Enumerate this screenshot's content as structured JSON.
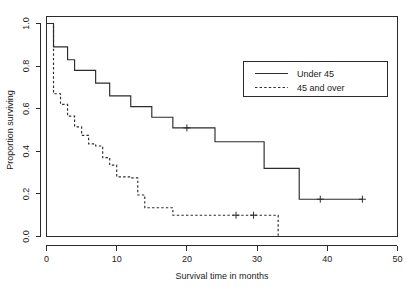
{
  "chart_data": {
    "type": "line",
    "title": "",
    "xlabel": "Survival time in months",
    "ylabel": "Proportion surviving",
    "xlim": [
      0,
      50
    ],
    "ylim": [
      0,
      1.0
    ],
    "xticks": [
      0,
      10,
      20,
      30,
      40,
      50
    ],
    "xtick_labels": [
      "0",
      "10",
      "20",
      "30",
      "40",
      "50"
    ],
    "yticks": [
      0.0,
      0.2,
      0.4,
      0.6,
      0.8,
      1.0
    ],
    "ytick_labels": [
      "0.0",
      "0.2",
      "0.4",
      "0.6",
      "0.8",
      "1.0"
    ],
    "grid": false,
    "legend_position": "upper right",
    "plot_style": "step-post",
    "series": [
      {
        "name": "Under 45",
        "linestyle": "solid",
        "color": "#2b2b2b",
        "x": [
          0,
          1,
          3,
          4,
          7,
          9,
          12,
          15,
          18,
          24,
          31,
          36,
          45
        ],
        "y": [
          1.0,
          0.89,
          0.83,
          0.78,
          0.72,
          0.66,
          0.61,
          0.56,
          0.51,
          0.445,
          0.445,
          0.32,
          0.175
        ],
        "steps": [
          {
            "time": 0,
            "survival": 1.0
          },
          {
            "time": 1,
            "survival": 0.89
          },
          {
            "time": 3,
            "survival": 0.83
          },
          {
            "time": 4,
            "survival": 0.78
          },
          {
            "time": 7,
            "survival": 0.72
          },
          {
            "time": 9,
            "survival": 0.66
          },
          {
            "time": 12,
            "survival": 0.61
          },
          {
            "time": 15,
            "survival": 0.56
          },
          {
            "time": 18,
            "survival": 0.51
          },
          {
            "time": 24,
            "survival": 0.445
          },
          {
            "time": 31,
            "survival": 0.32
          },
          {
            "time": 36,
            "survival": 0.175
          },
          {
            "time": 45,
            "survival": 0.175
          }
        ],
        "censored": [
          {
            "time": 20,
            "survival": 0.51
          },
          {
            "time": 39,
            "survival": 0.175
          },
          {
            "time": 45,
            "survival": 0.175
          }
        ]
      },
      {
        "name": "45 and over",
        "linestyle": "dashed",
        "color": "#2b2b2b",
        "x": [
          0,
          1,
          2,
          3,
          4,
          5,
          6,
          7,
          8,
          9,
          10,
          12,
          13,
          14,
          18,
          33
        ],
        "y": [
          1.0,
          0.67,
          0.62,
          0.565,
          0.515,
          0.475,
          0.435,
          0.425,
          0.37,
          0.335,
          0.28,
          0.275,
          0.195,
          0.135,
          0.1,
          0.0
        ],
        "steps": [
          {
            "time": 0,
            "survival": 1.0
          },
          {
            "time": 1,
            "survival": 0.67
          },
          {
            "time": 2,
            "survival": 0.62
          },
          {
            "time": 3,
            "survival": 0.565
          },
          {
            "time": 4,
            "survival": 0.515
          },
          {
            "time": 5,
            "survival": 0.475
          },
          {
            "time": 6,
            "survival": 0.435
          },
          {
            "time": 7,
            "survival": 0.425
          },
          {
            "time": 8,
            "survival": 0.37
          },
          {
            "time": 9,
            "survival": 0.335
          },
          {
            "time": 10,
            "survival": 0.28
          },
          {
            "time": 12,
            "survival": 0.275
          },
          {
            "time": 13,
            "survival": 0.195
          },
          {
            "time": 14,
            "survival": 0.135
          },
          {
            "time": 18,
            "survival": 0.1
          },
          {
            "time": 33,
            "survival": 0.0
          }
        ],
        "censored": [
          {
            "time": 27,
            "survival": 0.1
          },
          {
            "time": 29.5,
            "survival": 0.1
          }
        ]
      }
    ]
  },
  "legend": {
    "entries": [
      {
        "label": "Under 45",
        "style": "solid"
      },
      {
        "label": "45 and over",
        "style": "dashed"
      }
    ]
  }
}
